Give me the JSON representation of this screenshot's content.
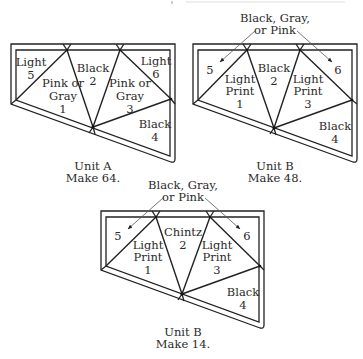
{
  "units": [
    {
      "id": "unit-a",
      "caption": {
        "title": "Unit A",
        "count": "Make 64."
      },
      "callout": null,
      "patches": [
        {
          "pos": "1",
          "lines": [
            "Pink or",
            "Gray",
            "1"
          ]
        },
        {
          "pos": "2",
          "lines": [
            "Black",
            "2"
          ]
        },
        {
          "pos": "3",
          "lines": [
            "Pink or",
            "Gray",
            "3"
          ]
        },
        {
          "pos": "4",
          "lines": [
            "Black",
            "4"
          ]
        },
        {
          "pos": "5",
          "lines": [
            "Light",
            "5"
          ]
        },
        {
          "pos": "6",
          "lines": [
            "Light",
            "6"
          ]
        }
      ]
    },
    {
      "id": "unit-b-48",
      "caption": {
        "title": "Unit B",
        "count": "Make 48."
      },
      "callout": {
        "lines": [
          "Black, Gray,",
          "or Pink"
        ],
        "targets": [
          "5",
          "6"
        ]
      },
      "patches": [
        {
          "pos": "1",
          "lines": [
            "Light",
            "Print",
            "1"
          ]
        },
        {
          "pos": "2",
          "lines": [
            "Black",
            "2"
          ]
        },
        {
          "pos": "3",
          "lines": [
            "Light",
            "Print",
            "3"
          ]
        },
        {
          "pos": "4",
          "lines": [
            "Black",
            "4"
          ]
        },
        {
          "pos": "5",
          "lines": [
            "5"
          ]
        },
        {
          "pos": "6",
          "lines": [
            "6"
          ]
        }
      ]
    },
    {
      "id": "unit-b-14",
      "caption": {
        "title": "Unit B",
        "count": "Make 14."
      },
      "callout": {
        "lines": [
          "Black, Gray,",
          "or Pink"
        ],
        "targets": [
          "5",
          "6"
        ]
      },
      "patches": [
        {
          "pos": "1",
          "lines": [
            "Light",
            "Print",
            "1"
          ]
        },
        {
          "pos": "2",
          "lines": [
            "Chintz",
            "2"
          ]
        },
        {
          "pos": "3",
          "lines": [
            "Light",
            "Print",
            "3"
          ]
        },
        {
          "pos": "4",
          "lines": [
            "Black",
            "4"
          ]
        },
        {
          "pos": "5",
          "lines": [
            "5"
          ]
        },
        {
          "pos": "6",
          "lines": [
            "6"
          ]
        }
      ]
    }
  ],
  "colors": {
    "line": "#222222",
    "text": "#2a2a2a",
    "background": "#ffffff"
  }
}
